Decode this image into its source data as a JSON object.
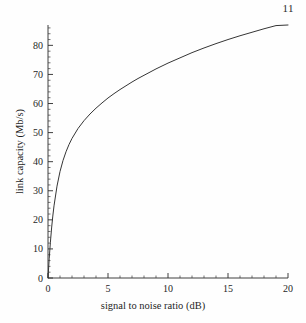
{
  "page": {
    "number": "11"
  },
  "chart_data": {
    "type": "line",
    "title": "",
    "xlabel": "signal to noise ratio (dB)",
    "ylabel": "link capacity (Mb/s)",
    "xlim": [
      0,
      20
    ],
    "ylim": [
      0,
      87
    ],
    "xticks": [
      0,
      5,
      10,
      15,
      20
    ],
    "xtick_labels": [
      "0",
      "5",
      "10",
      "15",
      "20"
    ],
    "yticks": [
      0,
      10,
      20,
      30,
      40,
      50,
      60,
      70,
      80
    ],
    "ytick_labels": [
      "0",
      "10",
      "20",
      "30",
      "40",
      "50",
      "60",
      "70",
      "80"
    ],
    "xminor_step": 1,
    "yminor_step": 2,
    "grid": false,
    "legend": null,
    "line_color": "#353535",
    "series": [
      {
        "name": "link capacity",
        "x": [
          0,
          0.1,
          0.2,
          0.3,
          0.4,
          0.5,
          0.75,
          1,
          1.25,
          1.5,
          1.75,
          2,
          2.5,
          3,
          3.5,
          4,
          4.5,
          5,
          5.5,
          6,
          6.5,
          7,
          7.5,
          8,
          8.5,
          9,
          9.5,
          10,
          11,
          12,
          13,
          14,
          15,
          16,
          17,
          18,
          19,
          20
        ],
        "y": [
          0,
          6.6,
          12.3,
          17.2,
          21.3,
          24.8,
          31.6,
          36.6,
          40.4,
          43.4,
          45.9,
          48.0,
          51.4,
          54.1,
          56.4,
          58.4,
          60.2,
          61.9,
          63.4,
          64.8,
          66.1,
          67.4,
          68.6,
          69.7,
          70.8,
          71.9,
          72.9,
          73.9,
          75.7,
          77.5,
          79.1,
          80.6,
          82.0,
          83.3,
          84.5,
          85.7,
          86.8,
          87.0
        ]
      }
    ]
  }
}
